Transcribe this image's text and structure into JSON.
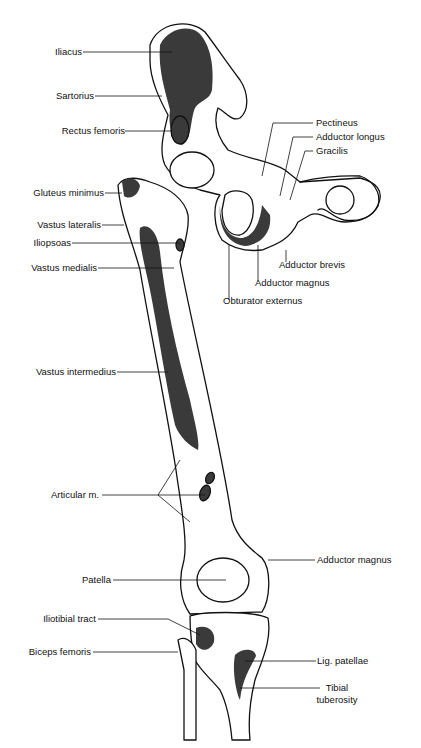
{
  "figure": {
    "colors": {
      "muscle_fill": "#3a3a3a",
      "bone_outline": "#111111",
      "background": "#ffffff"
    }
  },
  "labels_left": [
    {
      "id": "iliacus",
      "text": "Iliacus"
    },
    {
      "id": "sartorius",
      "text": "Sartorius"
    },
    {
      "id": "rectus-femoris",
      "text": "Rectus femoris"
    },
    {
      "id": "gluteus-minimus",
      "text": "Gluteus minimus"
    },
    {
      "id": "vastus-lateralis",
      "text": "Vastus lateralis"
    },
    {
      "id": "iliopsoas",
      "text": "Iliopsoas"
    },
    {
      "id": "vastus-medialis",
      "text": "Vastus medialis"
    },
    {
      "id": "vastus-intermedius",
      "text": "Vastus intermedius"
    },
    {
      "id": "articular-m",
      "text": "Articular m."
    },
    {
      "id": "patella",
      "text": "Patella"
    },
    {
      "id": "iliotibial-tract",
      "text": "Iliotibial tract"
    },
    {
      "id": "biceps-femoris",
      "text": "Biceps femoris"
    }
  ],
  "labels_right": [
    {
      "id": "pectineus",
      "text": "Pectineus"
    },
    {
      "id": "adductor-longus",
      "text": "Adductor longus"
    },
    {
      "id": "gracilis",
      "text": "Gracilis"
    },
    {
      "id": "adductor-brevis",
      "text": "Adductor brevis"
    },
    {
      "id": "adductor-magnus-upper",
      "text": "Adductor magnus"
    },
    {
      "id": "obturator-externus",
      "text": "Obturator externus"
    },
    {
      "id": "adductor-magnus-lower",
      "text": "Adductor magnus"
    },
    {
      "id": "lig-patellae",
      "text": "Lig. patellae"
    },
    {
      "id": "tibial-tuberosity-1",
      "text": "Tibial"
    },
    {
      "id": "tibial-tuberosity-2",
      "text": "tuberosity"
    }
  ]
}
